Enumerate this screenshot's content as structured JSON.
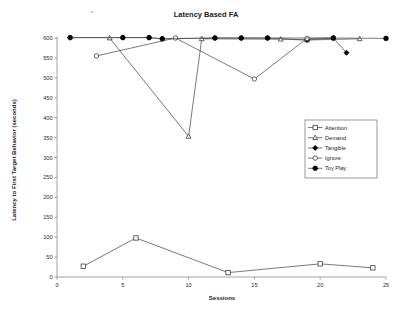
{
  "chart_data": {
    "type": "line",
    "title": "Latency Based FA",
    "xlabel": "Sessions",
    "ylabel": "Latency to First Target Behavior (seconds)",
    "xlim": [
      0,
      25
    ],
    "ylim": [
      0,
      600
    ],
    "xticks": [
      0,
      5,
      10,
      15,
      20,
      25
    ],
    "yticks": [
      0,
      50,
      100,
      150,
      200,
      250,
      300,
      350,
      400,
      450,
      500,
      550,
      600
    ],
    "grid": false,
    "legend_position": "right-middle",
    "series": [
      {
        "name": "Attention",
        "marker": "open-square",
        "x": [
          2,
          6,
          13,
          20,
          24
        ],
        "y": [
          27,
          98,
          11,
          33,
          23
        ]
      },
      {
        "name": "Demand",
        "marker": "open-triangle",
        "x": [
          4,
          10,
          11,
          17,
          19,
          23
        ],
        "y": [
          600,
          353,
          598,
          597,
          595,
          598
        ]
      },
      {
        "name": "Tangible",
        "marker": "filled-diamond",
        "x": [
          1,
          5,
          7,
          8,
          12,
          14,
          16,
          19,
          21,
          22
        ],
        "y": [
          601,
          601,
          601,
          598,
          600,
          600,
          600,
          595,
          600,
          563
        ]
      },
      {
        "name": "Ignore",
        "marker": "open-circle",
        "x": [
          3,
          9,
          15,
          19,
          21
        ],
        "y": [
          555,
          600,
          497,
          599,
          600
        ]
      },
      {
        "name": "Toy Play",
        "marker": "filled-circle",
        "x": [
          1,
          5,
          7,
          8,
          12,
          14,
          16,
          21,
          25
        ],
        "y": [
          601,
          601,
          601,
          598,
          600,
          600,
          600,
          600,
          599
        ]
      }
    ]
  },
  "legend": {
    "entries": [
      {
        "label": "Attention"
      },
      {
        "label": "Demand"
      },
      {
        "label": "Tangible"
      },
      {
        "label": "Ignore"
      },
      {
        "label": "Toy Play"
      }
    ]
  }
}
